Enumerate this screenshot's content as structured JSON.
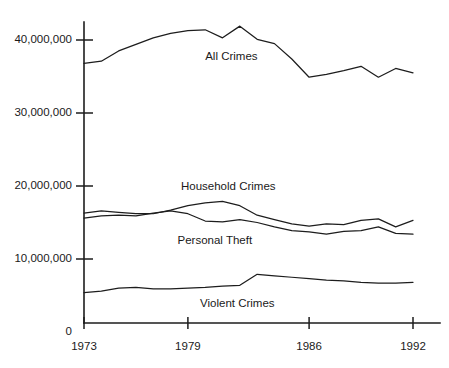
{
  "chart_data": {
    "type": "line",
    "title": "",
    "subtitle": "",
    "xlabel": "",
    "ylabel": "",
    "grid": false,
    "legend_position": "inline-annotations",
    "x": [
      1973,
      1974,
      1975,
      1976,
      1977,
      1978,
      1979,
      1980,
      1981,
      1982,
      1983,
      1984,
      1985,
      1986,
      1987,
      1988,
      1989,
      1990,
      1991,
      1992
    ],
    "xlim": [
      1973,
      1992
    ],
    "ylim": [
      0,
      44000000
    ],
    "xticks": [
      1973,
      1979,
      1986,
      1992
    ],
    "xtick_labels": [
      "1973",
      "1979",
      "1986",
      "1992"
    ],
    "yticks": [
      0,
      10000000,
      20000000,
      30000000,
      40000000
    ],
    "ytick_labels": [
      "0",
      "10,000,000",
      "20,000,000",
      "30,000,000",
      "40,000,000"
    ],
    "series": [
      {
        "name": "All Crimes",
        "label": "All Crimes",
        "color": "#1d1d1d",
        "values": [
          36800000,
          37100000,
          38500000,
          39400000,
          40300000,
          40900000,
          41300000,
          41400000,
          40300000,
          41900000,
          40100000,
          39500000,
          37400000,
          34900000,
          35300000,
          35800000,
          36400000,
          34900000,
          36100000,
          35500000
        ]
      },
      {
        "name": "Household Crimes",
        "label": "Household Crimes",
        "color": "#1d1d1d",
        "values": [
          16300000,
          16600000,
          16400000,
          16200000,
          16200000,
          16700000,
          17300000,
          17700000,
          17900000,
          17300000,
          16000000,
          15400000,
          14800000,
          14500000,
          14800000,
          14700000,
          15300000,
          15500000,
          14400000,
          15300000
        ]
      },
      {
        "name": "Personal Theft",
        "label": "Personal Theft",
        "color": "#1d1d1d",
        "values": [
          15600000,
          15900000,
          16000000,
          15900000,
          16300000,
          16600000,
          16200000,
          15200000,
          15100000,
          15400000,
          15000000,
          14400000,
          13900000,
          13700000,
          13400000,
          13800000,
          13900000,
          14400000,
          13500000,
          13400000
        ]
      },
      {
        "name": "Violent Crimes",
        "label": "Violent Crimes",
        "color": "#1d1d1d",
        "values": [
          5400000,
          5600000,
          6000000,
          6100000,
          5900000,
          5900000,
          6000000,
          6100000,
          6300000,
          6400000,
          7900000,
          7700000,
          7500000,
          7300000,
          7100000,
          7000000,
          6800000,
          6700000,
          6700000,
          6800000
        ]
      }
    ],
    "annotations": [
      {
        "text": "All Crimes",
        "x": 1980,
        "y": 37300000
      },
      {
        "text": "Household Crimes",
        "x": 1978.6,
        "y": 19400000
      },
      {
        "text": "Personal Theft",
        "x": 1978.4,
        "y": 12000000
      },
      {
        "text": "Violent Crimes",
        "x": 1979.7,
        "y": 3400000
      }
    ]
  }
}
